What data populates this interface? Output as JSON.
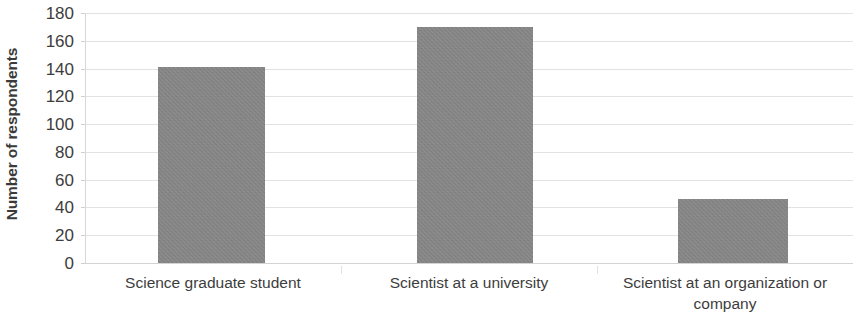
{
  "chart_data": {
    "type": "bar",
    "title": "",
    "subtitle": "",
    "xlabel": "",
    "ylabel": "Number of respondents",
    "categories": [
      "Science graduate student",
      "Scientist at a university",
      "Scientist at an organization or company"
    ],
    "values": [
      141,
      170,
      46
    ],
    "ylim": [
      0,
      180
    ],
    "ytick_step": 20,
    "yticks": [
      "180",
      "160",
      "140",
      "120",
      "100",
      "80",
      "60",
      "40",
      "20",
      "0"
    ],
    "grid": true,
    "legend": false,
    "legend_position": "none",
    "bar_color": "#8b8b8b",
    "gridline_color": "#e2e2e2",
    "text_color": "#3d3d3d"
  },
  "axis": {
    "y_title": "Number of respondents"
  },
  "categories_display": [
    {
      "line1": "Science graduate student",
      "line2": ""
    },
    {
      "line1": "Scientist at a university",
      "line2": ""
    },
    {
      "line1": "Scientist at an organization or",
      "line2": "company"
    }
  ]
}
